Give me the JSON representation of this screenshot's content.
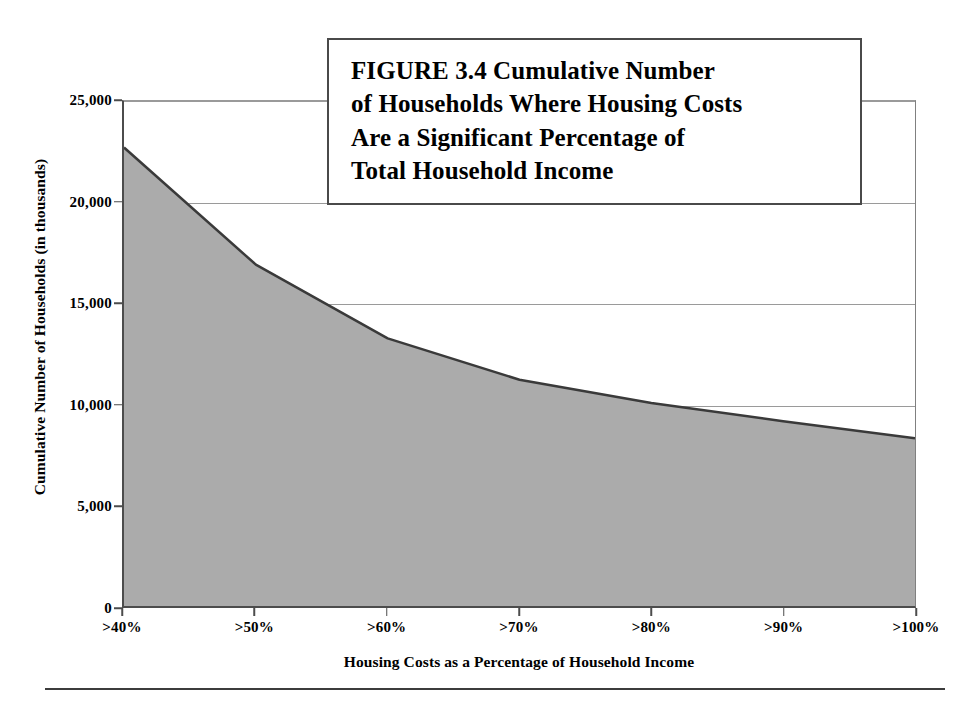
{
  "figure": {
    "title_lines": [
      "FIGURE 3.4  Cumulative Number",
      "of Households Where Housing Costs",
      "Are a Significant Percentage of",
      "Total Household Income"
    ],
    "title_full": "FIGURE 3.4 Cumulative Number of Households Where Housing Costs Are a Significant Percentage of Total Household Income",
    "area_fill_color": "#ababab",
    "area_line_color": "#3a3a3a",
    "gridline_color": "#9a9a9a",
    "axis_color": "#4c4c4c",
    "background_color": "#ffffff"
  },
  "chart_data": {
    "type": "area",
    "title": "FIGURE 3.4  Cumulative Number of Households Where Housing Costs Are a Significant Percentage of Total Household Income",
    "xlabel": "Housing Costs as a Percentage of Household Income",
    "ylabel": "Cumulative Number of Households (in thousands)",
    "categories": [
      ">40%",
      ">50%",
      ">60%",
      ">70%",
      ">80%",
      ">90%",
      ">100%"
    ],
    "values": [
      22700,
      16900,
      13250,
      11200,
      10050,
      9150,
      8300
    ],
    "x_tick_labels": [
      ">40%",
      ">50%",
      ">60%",
      ">70%",
      ">80%",
      ">90%",
      ">100%"
    ],
    "y_tick_labels": [
      "25,000",
      "20,000",
      "15,000",
      "10,000",
      "5,000",
      "0"
    ],
    "y_tick_values": [
      25000,
      20000,
      15000,
      10000,
      5000,
      0
    ],
    "ylim": [
      0,
      25000
    ],
    "grid": true,
    "legend": "none",
    "series": [
      {
        "name": "Cumulative Number of Households (in thousands)",
        "values": [
          22700,
          16900,
          13250,
          11200,
          10050,
          9150,
          8300
        ]
      }
    ]
  }
}
